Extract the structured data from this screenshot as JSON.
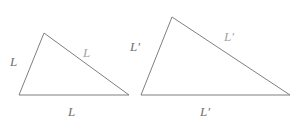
{
  "figure": {
    "background_color": "#ffffff",
    "stroke_color": "#7f7f7f",
    "label_color": "#8a8a8a",
    "label_color_light": "#a3a3a3",
    "width": 302,
    "height": 134
  },
  "shapes": {
    "small_triangle": {
      "name": "small-triangle",
      "points": "19,95 44,33 129,95",
      "vertices": [
        {
          "x": 19,
          "y": 95
        },
        {
          "x": 44,
          "y": 33
        },
        {
          "x": 129,
          "y": 95
        }
      ]
    },
    "large_triangle": {
      "name": "large-triangle",
      "points": "141,95 172,17 290,95",
      "vertices": [
        {
          "x": 141,
          "y": 95
        },
        {
          "x": 172,
          "y": 17
        },
        {
          "x": 290,
          "y": 95
        }
      ]
    }
  },
  "labels": {
    "small": {
      "left": "L",
      "base": "L",
      "hypotenuse": "L"
    },
    "large": {
      "left": "L′",
      "base": "L′",
      "hypotenuse": "L′"
    }
  }
}
